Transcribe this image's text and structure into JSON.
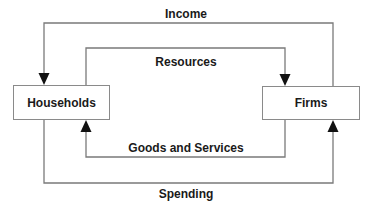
{
  "diagram": {
    "nodes": {
      "households": {
        "label": "Households"
      },
      "firms": {
        "label": "Firms"
      }
    },
    "flows": {
      "income": {
        "label": "Income",
        "from": "Firms",
        "to": "Households"
      },
      "resources": {
        "label": "Resources",
        "from": "Households",
        "to": "Firms"
      },
      "goods_services": {
        "label": "Goods and Services",
        "from": "Firms",
        "to": "Households"
      },
      "spending": {
        "label": "Spending",
        "from": "Households",
        "to": "Firms"
      }
    },
    "colors": {
      "line": "#7a7a7a",
      "arrow": "#111111",
      "text": "#1a1a1a"
    }
  }
}
